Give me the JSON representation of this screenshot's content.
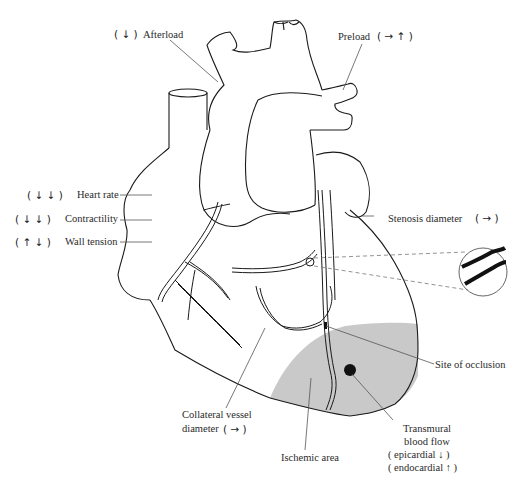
{
  "figure": {
    "colors": {
      "line": "#1a1a1a",
      "leader": "#555555",
      "ischemic_fill": "#c8c8c8",
      "background": "#ffffff"
    }
  },
  "labels": {
    "afterload": {
      "arrows": "( ↓ )",
      "text": "Afterload"
    },
    "preload": {
      "text": "Preload",
      "arrows": "( → ↑ )"
    },
    "heart_rate": {
      "arrows": "( ↓ ↓ )",
      "text": "Heart rate"
    },
    "contractility": {
      "arrows": "( ↓ ↓ )",
      "text": "Contractility"
    },
    "wall_tension": {
      "arrows": "( ↑ ↓ )",
      "text": "Wall tension"
    },
    "stenosis_diameter": {
      "text": "Stenosis diameter",
      "arrows": "( → )"
    },
    "site_of_occlusion": {
      "text": "Site of occlusion"
    },
    "collateral": {
      "line1": "Collateral vessel",
      "line2": "diameter",
      "arrows": "( → )"
    },
    "ischemic_area": {
      "text": "Ischemic area"
    },
    "transmural": {
      "line1": "Transmural",
      "line2": "blood flow",
      "line3": "( epicardial ↓ )",
      "line4": "( endocardial ↑ )"
    }
  }
}
